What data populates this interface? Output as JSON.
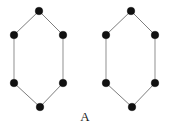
{
  "figure": {
    "caption": "A",
    "background_color": "#ffffff",
    "vertex_color": "#111111",
    "edge_color": "#9a9a9a",
    "vertex_radius": 3.8,
    "edge_width": 1.1,
    "graphs": [
      {
        "name": "hexagon-left",
        "vertices": [
          {
            "name": "top",
            "x": 39,
            "y": 11
          },
          {
            "name": "upper-right",
            "x": 63,
            "y": 35
          },
          {
            "name": "lower-right",
            "x": 63,
            "y": 83
          },
          {
            "name": "bottom",
            "x": 40,
            "y": 107
          },
          {
            "name": "lower-left",
            "x": 14,
            "y": 83
          },
          {
            "name": "upper-left",
            "x": 14,
            "y": 35
          }
        ],
        "edges": [
          {
            "from": 0,
            "to": 1,
            "kind": "diagonal"
          },
          {
            "from": 1,
            "to": 2,
            "kind": "vertical"
          },
          {
            "from": 2,
            "to": 3,
            "kind": "diagonal"
          },
          {
            "from": 3,
            "to": 4,
            "kind": "diagonal"
          },
          {
            "from": 4,
            "to": 5,
            "kind": "vertical"
          },
          {
            "from": 5,
            "to": 0,
            "kind": "diagonal"
          }
        ]
      },
      {
        "name": "hexagon-right",
        "vertices": [
          {
            "name": "top",
            "x": 131,
            "y": 11
          },
          {
            "name": "upper-right",
            "x": 155,
            "y": 35
          },
          {
            "name": "lower-right",
            "x": 155,
            "y": 83
          },
          {
            "name": "bottom",
            "x": 132,
            "y": 107
          },
          {
            "name": "lower-left",
            "x": 106,
            "y": 83
          },
          {
            "name": "upper-left",
            "x": 106,
            "y": 35
          }
        ],
        "edges": [
          {
            "from": 0,
            "to": 1,
            "kind": "diagonal"
          },
          {
            "from": 1,
            "to": 2,
            "kind": "vertical"
          },
          {
            "from": 2,
            "to": 3,
            "kind": "diagonal"
          },
          {
            "from": 3,
            "to": 4,
            "kind": "diagonal"
          },
          {
            "from": 4,
            "to": 5,
            "kind": "vertical"
          },
          {
            "from": 5,
            "to": 0,
            "kind": "diagonal"
          }
        ]
      }
    ]
  }
}
